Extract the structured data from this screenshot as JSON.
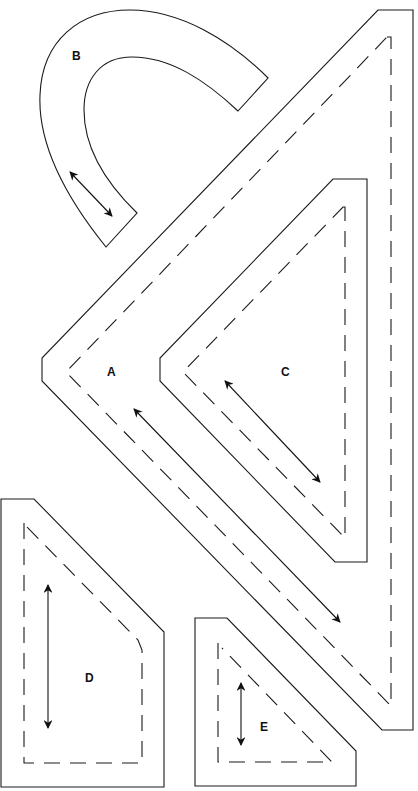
{
  "diagram": {
    "type": "sewing-pattern-pieces",
    "colors": {
      "line": "#1a1a1a",
      "background": "#ffffff"
    },
    "pieces": [
      {
        "id": "A",
        "label": "A",
        "shape": "large right-angle chevron strip",
        "has_seam_allowance": true,
        "grainline": "diagonal"
      },
      {
        "id": "B",
        "label": "B",
        "shape": "curved arch strip",
        "has_seam_allowance": false,
        "grainline": "diagonal"
      },
      {
        "id": "C",
        "label": "C",
        "shape": "triangle with blunted corners",
        "has_seam_allowance": true,
        "grainline": "diagonal"
      },
      {
        "id": "D",
        "label": "D",
        "shape": "pentagon (corner-cut rectangle)",
        "has_seam_allowance": true,
        "grainline": "vertical"
      },
      {
        "id": "E",
        "label": "E",
        "shape": "small pentagon (corner-cut square)",
        "has_seam_allowance": true,
        "grainline": "vertical"
      }
    ],
    "legend": {
      "solid_line": "cutting line",
      "dashed_line": "seam line",
      "double_arrow": "grainline"
    }
  }
}
